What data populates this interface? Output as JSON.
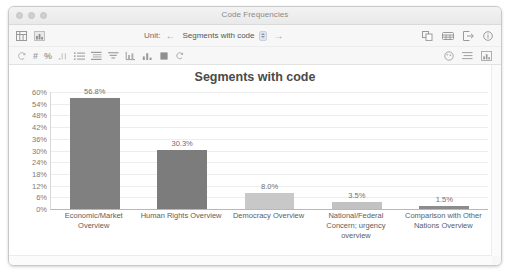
{
  "window": {
    "title": "Code Frequencies",
    "traffic_lights": [
      "close",
      "minimize",
      "zoom"
    ]
  },
  "toolbar": {
    "left_icons": [
      {
        "name": "table-view-icon",
        "glyph": "table"
      },
      {
        "name": "chart-view-icon",
        "glyph": "bars"
      }
    ],
    "unit_label": "Unit:",
    "prev_label": "←",
    "next_label": "→",
    "unit_value": "Segments with code",
    "unit_options": [
      "Segments with code"
    ],
    "right_icons": [
      {
        "name": "copy-icon"
      },
      {
        "name": "table-export-icon"
      },
      {
        "name": "export-icon"
      },
      {
        "name": "info-icon"
      }
    ],
    "row2_icons": [
      {
        "name": "pointer-icon",
        "glyph": "↺"
      },
      {
        "name": "hash-icon",
        "glyph": "#"
      },
      {
        "name": "percent-icon",
        "glyph": "%"
      },
      {
        "name": "decimal-icon",
        "glyph": ".1"
      },
      {
        "name": "list-icon"
      },
      {
        "name": "grouped-list-icon"
      },
      {
        "name": "sort-icon"
      },
      {
        "name": "axis-icon"
      },
      {
        "name": "bar-chart-icon"
      },
      {
        "name": "color-fill-icon"
      },
      {
        "name": "refresh-icon"
      }
    ],
    "row2_right_icons": [
      {
        "name": "palette-icon"
      },
      {
        "name": "legend-icon"
      },
      {
        "name": "chart-settings-icon"
      }
    ]
  },
  "chart_data": {
    "type": "bar",
    "title": "Segments with code",
    "xlabel": "",
    "ylabel": "",
    "categories": [
      "Economic/Market Overview",
      "Human Rights Overview",
      "Democracy Overview",
      "National/Federal Concern; urgency overview",
      "Comparison with Other Nations Overview"
    ],
    "values": [
      56.8,
      30.3,
      8.0,
      3.5,
      1.5
    ],
    "value_labels": [
      "56.8%",
      "30.3%",
      "8.0%",
      "3.5%",
      "1.5%"
    ],
    "bar_colors": [
      "#808080",
      "#7c7c7c",
      "#c8c8c8",
      "#c2c2c2",
      "#8c8c8c"
    ],
    "ylim": [
      0,
      60
    ],
    "yticks": [
      60,
      54,
      48,
      42,
      36,
      30,
      24,
      18,
      12,
      6,
      0
    ],
    "ytick_labels": [
      "60%",
      "54%",
      "48%",
      "42%",
      "36%",
      "30%",
      "24%",
      "18%",
      "12%",
      "6%",
      "0%"
    ],
    "grid": true,
    "legend": "none"
  },
  "colors": {
    "accent": "#8aa6cc",
    "bar_dark": "#808080",
    "bar_light": "#c8c8c8",
    "text": "#5d5d5d"
  }
}
